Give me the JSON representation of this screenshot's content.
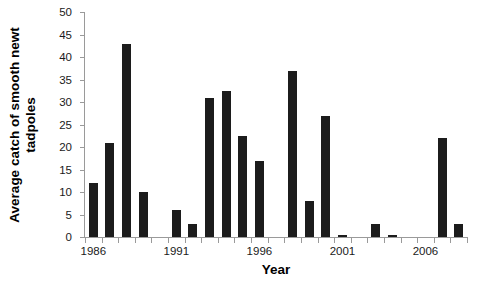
{
  "chart_data": {
    "type": "bar",
    "title": "",
    "xlabel": "Year",
    "ylabel_line1": "Average catch of smooth newt",
    "ylabel_line2": "tadpoles",
    "ylabel": "Average catch of smooth newt tadpoles",
    "ylim": [
      0,
      50
    ],
    "ytick_values": [
      0,
      5,
      10,
      15,
      20,
      25,
      30,
      35,
      40,
      45,
      50
    ],
    "ytick_labels": [
      "0",
      "5",
      "10",
      "15",
      "20",
      "25",
      "30",
      "35",
      "40",
      "45",
      "50"
    ],
    "xtick_labels": [
      "1986",
      "1991",
      "1996",
      "2001",
      "2006"
    ],
    "xtick_categories": [
      "1986",
      "1991",
      "1996",
      "2001",
      "2006"
    ],
    "grid": false,
    "legend": false,
    "bar_color": "#1c1c1c",
    "axis_color": "#9a9a9a",
    "categories": [
      "1986",
      "1987",
      "1988",
      "1989",
      "1990",
      "1991",
      "1992",
      "1993",
      "1994",
      "1995",
      "1996",
      "1997",
      "1998",
      "1999",
      "2000",
      "2001",
      "2002",
      "2003",
      "2004",
      "2005",
      "2006",
      "2007",
      "2008"
    ],
    "values": [
      12,
      21,
      43,
      10,
      0,
      6,
      3,
      31,
      32.5,
      22.5,
      17,
      0,
      37,
      8,
      27,
      0.5,
      0,
      3,
      0.5,
      0,
      0,
      22,
      3
    ]
  }
}
